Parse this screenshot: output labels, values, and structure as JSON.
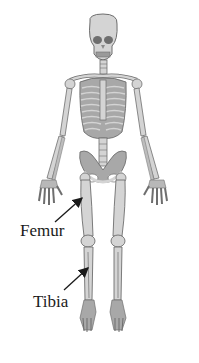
{
  "diagram": {
    "view": "anterior",
    "labels": [
      {
        "id": "femur",
        "text": "Femur",
        "points_to": "femur-bone"
      },
      {
        "id": "tibia",
        "text": "Tibia",
        "points_to": "tibia-bone"
      }
    ],
    "colors": {
      "bone_fill": "#d4d4d4",
      "bone_outline": "#6e6e6e",
      "dark_detail": "#8a8a8a",
      "arrow": "#1a1a1a",
      "text": "#1a1a1a",
      "background": "#ffffff"
    }
  }
}
